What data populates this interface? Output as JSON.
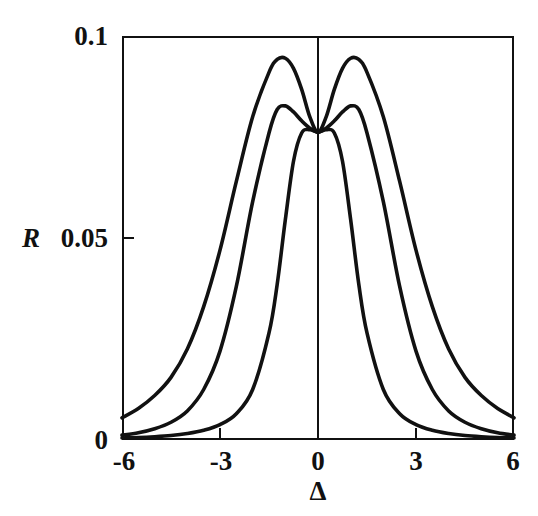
{
  "figure": {
    "title": "",
    "background_color": "#ffffff",
    "line_color": "#111111"
  },
  "axes": {
    "y": {
      "label": "R",
      "ticks": [
        {
          "value": 0,
          "label": "0"
        },
        {
          "value": 0.05,
          "label": "0.05"
        },
        {
          "value": 0.1,
          "label": "0.1"
        }
      ],
      "range": [
        0,
        0.1
      ]
    },
    "x": {
      "label": "Δ",
      "ticks": [
        {
          "value": -6,
          "label": "-6"
        },
        {
          "value": -3,
          "label": "-3"
        },
        {
          "value": 0,
          "label": "0"
        },
        {
          "value": 3,
          "label": "3"
        },
        {
          "value": 6,
          "label": "6"
        }
      ],
      "range": [
        -6,
        6
      ]
    }
  },
  "chart_data": {
    "type": "line",
    "title": "",
    "xlabel": "Δ",
    "ylabel": "R",
    "xlim": [
      -6,
      6
    ],
    "ylim": [
      0,
      0.1
    ],
    "grid": false,
    "legend": "none",
    "annotations": [
      "vertical reference line at Δ = 0",
      "all three curves intersect at Δ = 0, R ≈ 0.076"
    ],
    "x": [
      -6,
      -5.5,
      -5,
      -4.5,
      -4,
      -3.5,
      -3,
      -2.5,
      -2,
      -1.5,
      -1.25,
      -1,
      -0.75,
      -0.5,
      -0.25,
      0,
      0.25,
      0.5,
      0.75,
      1,
      1.25,
      1.5,
      2,
      2.5,
      3,
      3.5,
      4,
      4.5,
      5,
      5.5,
      6
    ],
    "series": [
      {
        "name": "narrow curve",
        "values": [
          0.0005,
          0.0006,
          0.0008,
          0.0011,
          0.0016,
          0.0024,
          0.0038,
          0.0065,
          0.0125,
          0.0265,
          0.0385,
          0.0545,
          0.069,
          0.076,
          0.0768,
          0.0762,
          0.0768,
          0.076,
          0.069,
          0.0545,
          0.0385,
          0.0265,
          0.0125,
          0.0065,
          0.0038,
          0.0024,
          0.0016,
          0.0011,
          0.0008,
          0.0006,
          0.0005
        ]
      },
      {
        "name": "medium bimodal curve",
        "values": [
          0.0012,
          0.0018,
          0.0028,
          0.0044,
          0.0072,
          0.0125,
          0.022,
          0.038,
          0.059,
          0.076,
          0.0818,
          0.0827,
          0.0812,
          0.079,
          0.0772,
          0.0762,
          0.0772,
          0.079,
          0.0812,
          0.0827,
          0.0818,
          0.076,
          0.059,
          0.038,
          0.022,
          0.0125,
          0.0072,
          0.0044,
          0.0028,
          0.0018,
          0.0012
        ]
      },
      {
        "name": "wide bimodal curve",
        "values": [
          0.0055,
          0.0078,
          0.011,
          0.0155,
          0.0225,
          0.033,
          0.047,
          0.064,
          0.08,
          0.091,
          0.0942,
          0.0945,
          0.092,
          0.0868,
          0.08,
          0.0762,
          0.08,
          0.0868,
          0.092,
          0.0945,
          0.0942,
          0.091,
          0.08,
          0.064,
          0.047,
          0.033,
          0.0225,
          0.0155,
          0.011,
          0.0078,
          0.0055
        ]
      }
    ]
  }
}
